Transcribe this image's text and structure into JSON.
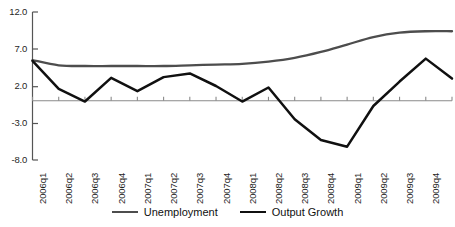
{
  "chart_data": {
    "type": "line",
    "title": "",
    "xlabel": "",
    "ylabel": "",
    "ylim": [
      -8.0,
      12.0
    ],
    "grid": false,
    "legend_position": "bottom",
    "y_ticks": [
      "12.0",
      "7.0",
      "2.0",
      "-3.0",
      "-8.0"
    ],
    "y_tick_values": [
      12.0,
      7.0,
      2.0,
      -3.0,
      -8.0
    ],
    "categories": [
      "2006q1",
      "2006q2",
      "2006q3",
      "2006q4",
      "2007q1",
      "2007q2",
      "2007q3",
      "2007q4",
      "2008q1",
      "2008q2",
      "2008q3",
      "2008q4",
      "2009q1",
      "2009q2",
      "2009q3",
      "2009q4",
      "2010q1"
    ],
    "series": [
      {
        "name": "Unemployment",
        "color": "#4d4d4d",
        "values": [
          5.5,
          4.8,
          4.7,
          4.7,
          4.7,
          4.7,
          4.8,
          4.9,
          5.0,
          5.3,
          5.8,
          6.6,
          7.6,
          8.6,
          9.2,
          9.4,
          9.4
        ]
      },
      {
        "name": "Output Growth",
        "color": "#101010",
        "values": [
          5.4,
          1.6,
          -0.1,
          3.1,
          1.3,
          3.2,
          3.7,
          2.0,
          -0.1,
          1.8,
          -2.5,
          -5.3,
          -6.2,
          -0.7,
          2.6,
          5.7,
          3.0
        ]
      }
    ]
  },
  "legend": {
    "entries": [
      {
        "label": "Unemployment",
        "color": "#4d4d4d"
      },
      {
        "label": "Output Growth",
        "color": "#101010"
      }
    ]
  }
}
